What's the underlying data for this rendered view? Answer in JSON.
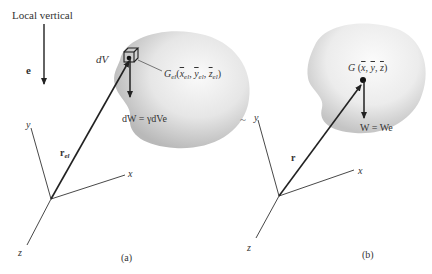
{
  "figure": {
    "local_vertical_label": "Local vertical",
    "unit_vector_label": "e",
    "tilde": "~",
    "panel_a": {
      "caption": "(a)",
      "element_label": "dV",
      "element_centroid": {
        "symbol": "G",
        "sub": "el",
        "coords_prefix": "(",
        "x": "x",
        "y": "y",
        "z": "z",
        "coord_sub": "el",
        "coords_suffix": ")"
      },
      "weight_label": "dW = γdVe",
      "position_vector": {
        "symbol": "r",
        "sub": "el"
      },
      "axes": {
        "x": "x",
        "y": "y",
        "z": "z"
      }
    },
    "panel_b": {
      "caption": "(b)",
      "centroid_label": "G",
      "centroid_coords": {
        "open": "(",
        "x": "x",
        "y": "y",
        "z": "z",
        "close": ")"
      },
      "weight_label": "W = We",
      "position_vector": "r",
      "axes": {
        "x": "x",
        "y": "y",
        "z": "z"
      }
    },
    "colors": {
      "ink": "#222222",
      "body_light": "#f4f4f4",
      "body_mid": "#d9d9d9",
      "body_dark": "#b5b5b5"
    }
  }
}
